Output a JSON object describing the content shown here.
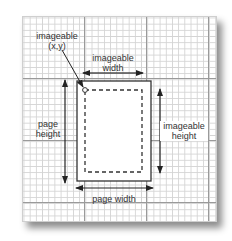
{
  "diagram": {
    "labels": {
      "imageable_xy_line1": "imageable",
      "imageable_xy_line2": "(x,y)",
      "imageable_width_line1": "imageable",
      "imageable_width_line2": "width",
      "page_height_line1": "page",
      "page_height_line2": "height",
      "imageable_height_line1": "imageable",
      "imageable_height_line2": "height",
      "page_width": "page width"
    },
    "colors": {
      "grid_minor": "#d4d4d4",
      "grid_major": "#9a9a9a",
      "stroke": "#333333",
      "background": "#ffffff"
    }
  }
}
